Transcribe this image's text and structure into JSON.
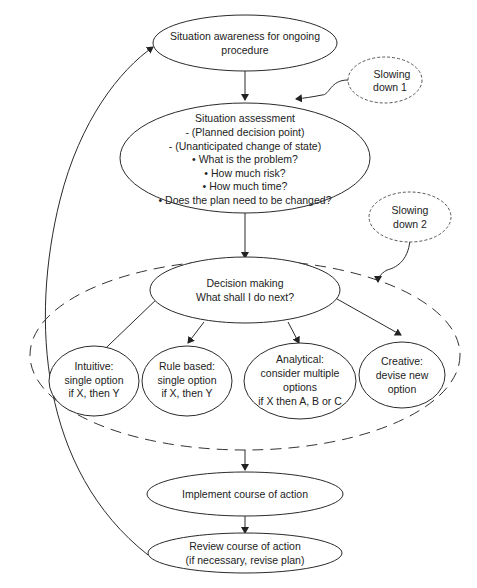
{
  "diagram": {
    "nodes": {
      "situation_awareness": {
        "lines": [
          "Situation awareness for ongoing",
          "procedure"
        ]
      },
      "slowing_down_1": {
        "lines": [
          "Slowing",
          "down 1"
        ]
      },
      "situation_assessment": {
        "title": "Situation assessment",
        "lines": [
          "- (Planned decision point)",
          "- (Unanticipated change of state)",
          "• What is the problem?",
          "• How much risk?",
          "• How much time?",
          "• Does the plan need to be changed?"
        ]
      },
      "slowing_down_2": {
        "lines": [
          "Slowing",
          "down 2"
        ]
      },
      "decision_making": {
        "lines": [
          "Decision making",
          "What shall I do next?"
        ]
      },
      "intuitive": {
        "lines": [
          "Intuitive:",
          "single option",
          "if X, then Y"
        ]
      },
      "rule_based": {
        "lines": [
          "Rule based:",
          "single option",
          "if X, then Y"
        ]
      },
      "analytical": {
        "lines": [
          "Analytical:",
          "consider multiple",
          "options",
          "if X then A, B or C"
        ]
      },
      "creative": {
        "lines": [
          "Creative:",
          "devise new",
          "option"
        ]
      },
      "implement": {
        "lines": [
          "Implement course of action"
        ]
      },
      "review": {
        "lines": [
          "Review course of action",
          "(if necessary, revise plan)"
        ]
      }
    },
    "colors": {
      "stroke": "#2a2a2a",
      "background": "#ffffff",
      "text": "#222222"
    }
  }
}
